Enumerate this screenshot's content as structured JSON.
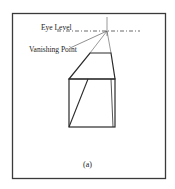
{
  "figure": {
    "labels": {
      "eye_level": "Eye Level",
      "vanishing_point": "Vanishing Point",
      "caption": "(a)"
    },
    "colors": {
      "stroke": "#2a2a2a",
      "frame": "#3a3a3a",
      "background": "#ffffff"
    }
  }
}
